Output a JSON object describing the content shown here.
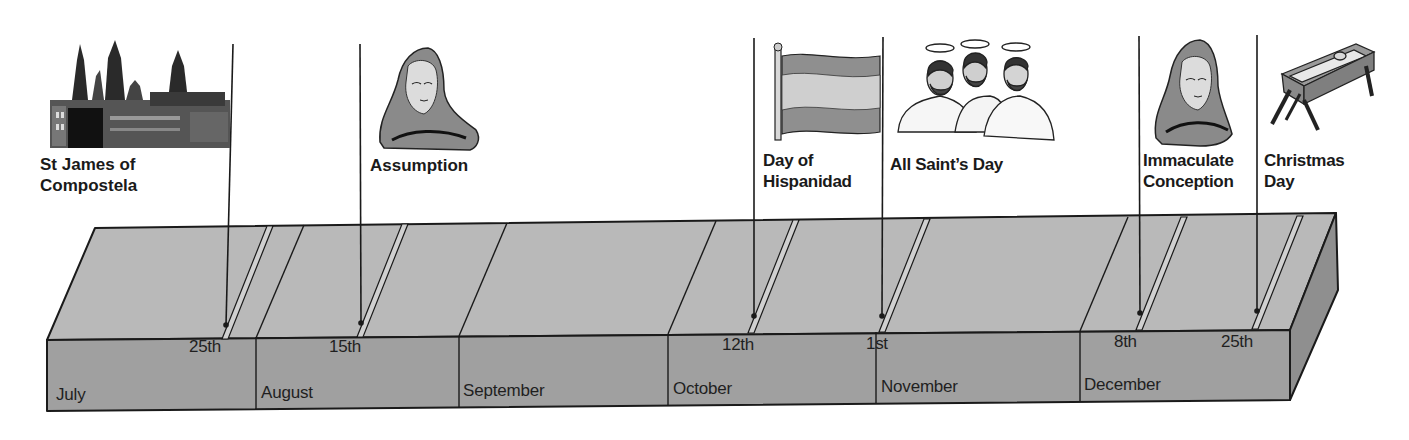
{
  "colors": {
    "top_face": "#b8b8b8",
    "front_face": "#9e9e9e",
    "side_face": "#8e8e8e",
    "outline": "#1a1a1a",
    "flag_red": "#8f8f8f",
    "flag_yellow": "#c9c9c9"
  },
  "months": [
    {
      "label": "July"
    },
    {
      "label": "August"
    },
    {
      "label": "September"
    },
    {
      "label": "October"
    },
    {
      "label": "November"
    },
    {
      "label": "December"
    }
  ],
  "events": [
    {
      "name": "St James of\nCompostela",
      "date": "25th",
      "month": "July",
      "icon": "cathedral-icon"
    },
    {
      "name": "Assumption",
      "date": "15th",
      "month": "August",
      "icon": "virgin-mary-icon"
    },
    {
      "name": "Day of\nHispanidad",
      "date": "12th",
      "month": "October",
      "icon": "spanish-flag-icon"
    },
    {
      "name": "All Saint’s Day",
      "date": "1st",
      "month": "November",
      "icon": "saints-icon"
    },
    {
      "name": "Immaculate\nConception",
      "date": "8th",
      "month": "December",
      "icon": "virgin-mary-icon"
    },
    {
      "name": "Christmas\nDay",
      "date": "25th",
      "month": "December",
      "icon": "manger-icon"
    }
  ]
}
